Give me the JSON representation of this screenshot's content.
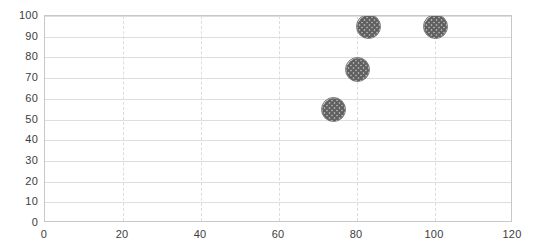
{
  "chart_data": {
    "type": "scatter",
    "title": "",
    "subtitle": "",
    "xlabel": "",
    "ylabel": "",
    "xlim": [
      0,
      120
    ],
    "ylim": [
      0,
      100
    ],
    "grid": true,
    "grid_horizontal": "solid",
    "grid_vertical": "dashed",
    "legend": false,
    "legend_position": "none",
    "x_ticks": [
      0,
      20,
      40,
      60,
      80,
      100,
      120
    ],
    "y_ticks": [
      0,
      10,
      20,
      30,
      40,
      50,
      60,
      70,
      80,
      90,
      100
    ],
    "x_tick_labels": [
      "0",
      "20",
      "40",
      "60",
      "80",
      "100",
      "120"
    ],
    "y_tick_labels": [
      "0",
      "10",
      "20",
      "30",
      "40",
      "50",
      "60",
      "70",
      "80",
      "90",
      "100"
    ],
    "marker_shape": "circle",
    "marker_fill": "crosshatch",
    "marker_color": "#808080",
    "marker_edge_color": "#6e6e6e",
    "series": [
      {
        "name": "Series 1",
        "points": [
          {
            "x": 74,
            "y": 55
          },
          {
            "x": 80,
            "y": 74
          },
          {
            "x": 83,
            "y": 95
          },
          {
            "x": 100,
            "y": 95
          }
        ]
      }
    ]
  },
  "colors": {
    "plot_border": "#c8c8c8",
    "gridline_horizontal": "#dedede",
    "gridline_vertical": "#dcdcdc",
    "tick_label": "#3d3d3d",
    "background": "#ffffff"
  }
}
